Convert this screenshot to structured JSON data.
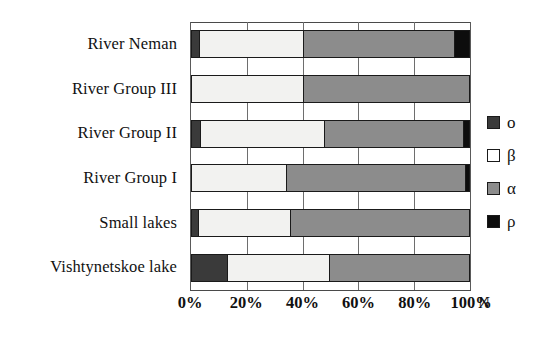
{
  "chart_data": {
    "type": "bar",
    "orientation": "horizontal",
    "stacked": true,
    "normalized_percent": true,
    "title": "",
    "xlabel": "N",
    "ylabel": "",
    "xlim": [
      0,
      100
    ],
    "xticks": [
      0,
      20,
      40,
      60,
      80,
      100
    ],
    "xtick_labels": [
      "0%",
      "20%",
      "40%",
      "60%",
      "80%",
      "100%"
    ],
    "grid": true,
    "legend_position": "right",
    "categories": [
      "River Neman",
      "River Group III",
      "River Group II",
      "River Group I",
      "Small lakes",
      "Vishtynetskoe lake"
    ],
    "series": [
      {
        "name": "o",
        "color": "#3a3a3a",
        "values": [
          2.5,
          0,
          3.0,
          0,
          2.0,
          12.5
        ]
      },
      {
        "name": "β",
        "color": "#f2f2f0",
        "values": [
          37.5,
          40.0,
          44.5,
          34.0,
          33.5,
          37.0
        ]
      },
      {
        "name": "α",
        "color": "#8c8c8c",
        "values": [
          54.5,
          60.0,
          50.5,
          64.5,
          64.5,
          50.5
        ]
      },
      {
        "name": "ρ",
        "color": "#0d0d0d",
        "values": [
          5.5,
          0,
          2.0,
          1.5,
          0,
          0
        ]
      }
    ],
    "legend": [
      {
        "label": "o",
        "color": "#3a3a3a"
      },
      {
        "label": "β",
        "color": "#ffffff"
      },
      {
        "label": "α",
        "color": "#8c8c8c"
      },
      {
        "label": "ρ",
        "color": "#0d0d0d"
      }
    ]
  }
}
